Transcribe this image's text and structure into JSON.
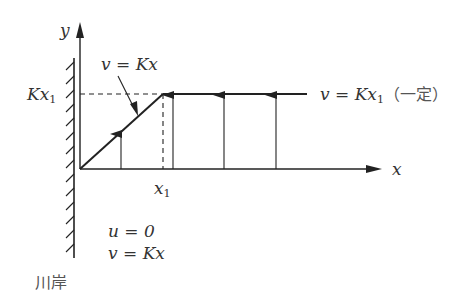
{
  "diagram": {
    "axes": {
      "x_label": "x",
      "y_label": "y"
    },
    "labels": {
      "y_level": "Kx",
      "y_level_sub": "1",
      "x_tick": "x",
      "x_tick_sub": "1",
      "slope_eq": "v = Kx",
      "flat_eq_prefix": "v = Kx",
      "flat_eq_sub": "1",
      "flat_eq_note": "（一定）",
      "bc_u": "u = 0",
      "bc_v": "v = Kx",
      "wall_label": "川岸"
    },
    "colors": {
      "line": "#222222",
      "text": "#333333"
    }
  }
}
